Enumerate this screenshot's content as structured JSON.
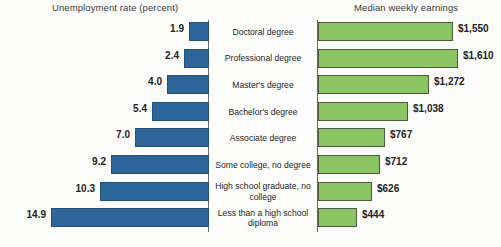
{
  "chart_data": {
    "type": "bar",
    "title": "",
    "orientation": "horizontal-diverging",
    "panels": [
      {
        "name": "unemployment",
        "title": "Unemployment rate (percent)",
        "ylabel": "",
        "xlabel": "Unemployment rate (percent)",
        "color": "#2e6699",
        "direction": "left",
        "max": 14.9
      },
      {
        "name": "earnings",
        "title": "Median weekly earnings",
        "ylabel": "",
        "xlabel": "Median weekly earnings",
        "color": "#8cc563",
        "direction": "right",
        "max": 1610
      }
    ],
    "categories": [
      "Doctoral degree",
      "Professional degree",
      "Master's degree",
      "Bachelor's degree",
      "Associate degree",
      "Some college, no degree",
      "High school graduate, no college",
      "Less than a high school diploma"
    ],
    "series": [
      {
        "name": "Unemployment rate (percent)",
        "unit": "percent",
        "values": [
          1.9,
          2.4,
          4.0,
          5.4,
          7.0,
          9.2,
          10.3,
          14.9
        ],
        "labels": [
          "1.9",
          "2.4",
          "4.0",
          "5.4",
          "7.0",
          "9.2",
          "10.3",
          "14.9"
        ]
      },
      {
        "name": "Median weekly earnings",
        "unit": "dollars",
        "values": [
          1550,
          1610,
          1272,
          1038,
          767,
          712,
          626,
          444
        ],
        "labels": [
          "$1,550",
          "$1,610",
          "$1,272",
          "$1,038",
          "$767",
          "$712",
          "$626",
          "$444"
        ]
      }
    ],
    "grid": false,
    "legend": "none"
  },
  "panels": {
    "left_title": "Unemployment rate (percent)",
    "right_title": "Median weekly earnings"
  },
  "rows": [
    {
      "cat": "Doctoral degree",
      "unemp": "1.9",
      "earn": "$1,550"
    },
    {
      "cat": "Professional degree",
      "unemp": "2.4",
      "earn": "$1,610"
    },
    {
      "cat": "Master's degree",
      "unemp": "4.0",
      "earn": "$1,272"
    },
    {
      "cat": "Bachelor's degree",
      "unemp": "5.4",
      "earn": "$1,038"
    },
    {
      "cat": "Associate degree",
      "unemp": "7.0",
      "earn": "$767"
    },
    {
      "cat": "Some college, no degree",
      "unemp": "9.2",
      "earn": "$712"
    },
    {
      "cat": "High school graduate, no college",
      "unemp": "10.3",
      "earn": "$626"
    },
    {
      "cat": "Less than a high school diploma",
      "unemp": "14.9",
      "earn": "$444"
    }
  ],
  "colors": {
    "unemployment_bar": "#2e6699",
    "earnings_bar": "#8cc563",
    "axis": "#6b6b63",
    "background": "#fdfdfb"
  }
}
